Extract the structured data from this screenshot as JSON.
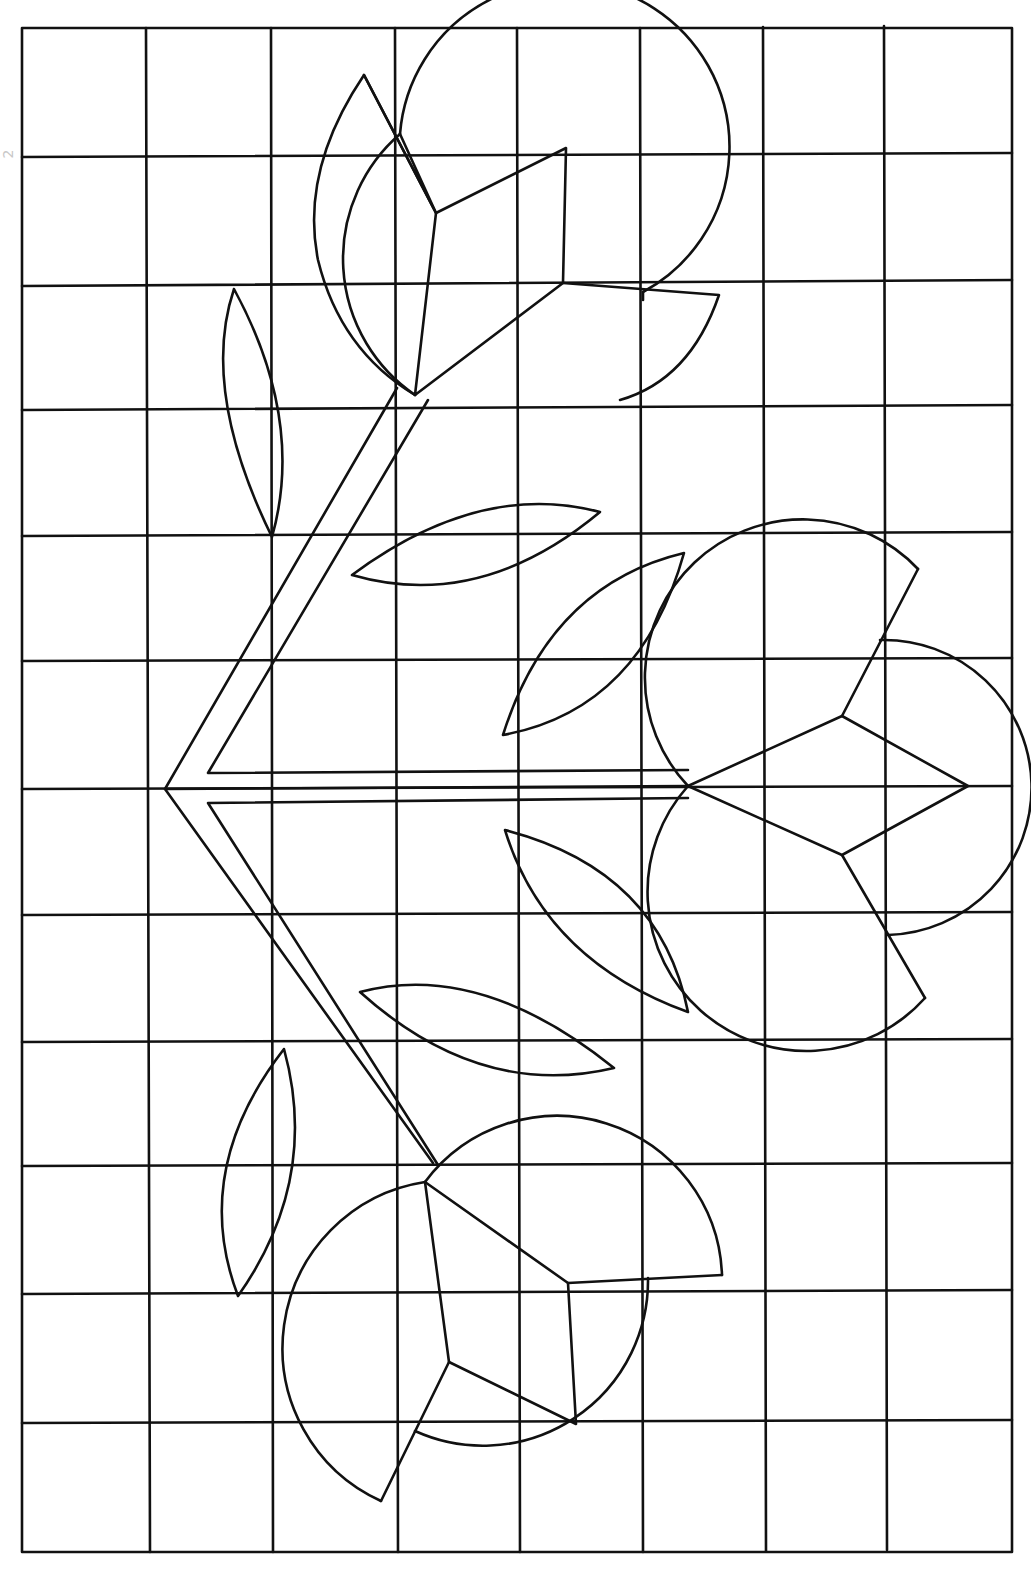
{
  "page_mark": "2",
  "colors": {
    "line": "#111111",
    "background": "#ffffff"
  },
  "grid": {
    "columns": 8,
    "rows": 12,
    "left": 22,
    "top": 28,
    "right": 1012,
    "bottom": 1552
  }
}
